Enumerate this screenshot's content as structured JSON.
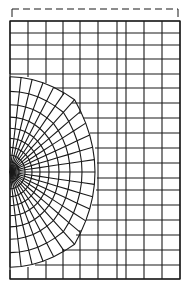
{
  "figure": {
    "type": "finite-element mesh",
    "colors": {
      "line": "#1a1a1a",
      "background": "#ffffff"
    }
  },
  "boundary_marker": {
    "style": "dashed",
    "y": 9,
    "x_start": 12,
    "x_end": 178,
    "end_ticks_to_y": 17
  },
  "frame": {
    "left": 10,
    "right": 180,
    "top": 21,
    "bottom": 279
  },
  "crack_tip": {
    "x": 10,
    "y": 172
  },
  "radial_mesh": {
    "spokes": 24,
    "rings": [
      4,
      9,
      15,
      22,
      30,
      39,
      49,
      60,
      72,
      85
    ],
    "blend_start_ring": 6
  },
  "outer_grid": {
    "columns_x": [
      10,
      28,
      46,
      63,
      80,
      98,
      117,
      126,
      144,
      162,
      180
    ],
    "rows_y": [
      21,
      33,
      45,
      59,
      74,
      88,
      103,
      118,
      133,
      148,
      163,
      178,
      190,
      205,
      220,
      235,
      250,
      265,
      279
    ]
  }
}
